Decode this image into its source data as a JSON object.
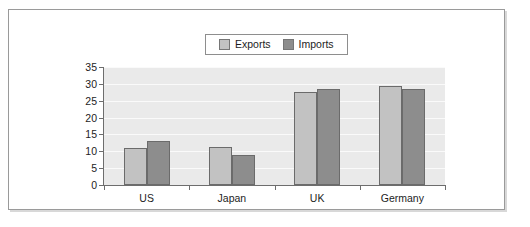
{
  "chart_data": {
    "type": "bar",
    "title": "",
    "subtitle": "",
    "xlabel": "",
    "ylabel": "",
    "categories": [
      "US",
      "Japan",
      "UK",
      "Germany"
    ],
    "series": [
      {
        "name": "Exports",
        "values": [
          11,
          11.2,
          27.5,
          29.5
        ],
        "color": "#c2c2c2"
      },
      {
        "name": "Imports",
        "values": [
          13.1,
          9,
          28.5,
          28.5
        ],
        "color": "#8d8d8d"
      }
    ],
    "ylim": [
      0,
      35
    ],
    "yticks": [
      0,
      5,
      10,
      15,
      20,
      25,
      30,
      35
    ],
    "ytick_labels": [
      "0",
      "5",
      "10",
      "15",
      "20",
      "25",
      "30",
      "35"
    ],
    "grid": true,
    "grid_axis": "y",
    "legend_position": "top-center",
    "plot_background": "#eaeaea",
    "gridline_color": "#fafafa",
    "axis_color": "#6d6d6d",
    "bar_border_color": "#6b6b6b",
    "frame_color": "#9a9a9a"
  },
  "legend": {
    "entries": [
      {
        "label": "Exports",
        "color": "#c2c2c2"
      },
      {
        "label": "Imports",
        "color": "#8d8d8d"
      }
    ]
  }
}
